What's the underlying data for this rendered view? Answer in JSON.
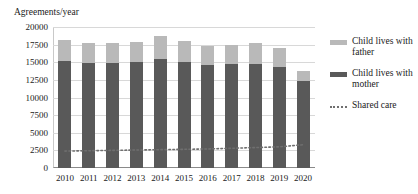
{
  "chart_data": {
    "type": "bar",
    "title": "Agreements/year",
    "xlabel": "",
    "ylabel": "Agreements/year",
    "ylim": [
      0,
      20000
    ],
    "ytick_step": 2500,
    "yticks": [
      20000,
      17500,
      15000,
      12500,
      10000,
      7500,
      5000,
      2500,
      0
    ],
    "ytick_labels": [
      "20000",
      "17500",
      "15000",
      "12500",
      "10000",
      "7500",
      "5000",
      "2500",
      "0"
    ],
    "categories": [
      "2010",
      "2011",
      "2012",
      "2013",
      "2014",
      "2015",
      "2016",
      "2017",
      "2018",
      "2019",
      "2020"
    ],
    "grid": true,
    "stacked": true,
    "legend_position": "right",
    "series": [
      {
        "name": "Child lives with mother",
        "type": "bar",
        "color": "#595959",
        "values": [
          15200,
          14900,
          14900,
          15000,
          15400,
          15100,
          14600,
          14700,
          14800,
          14300,
          12300
        ]
      },
      {
        "name": "Child lives with father",
        "type": "bar",
        "color": "#b9b9b9",
        "values": [
          3000,
          2900,
          2800,
          2900,
          3300,
          2900,
          2700,
          2800,
          2900,
          2700,
          1400
        ]
      },
      {
        "name": "Shared care",
        "type": "line",
        "style": "dotted",
        "color": "#6f6f6f",
        "values": [
          2400,
          2450,
          2500,
          2550,
          2600,
          2650,
          2700,
          2800,
          2900,
          3000,
          3300
        ]
      }
    ],
    "totals": [
      18200,
      17800,
      17700,
      17900,
      18700,
      18000,
      17300,
      17500,
      17700,
      17000,
      13700
    ]
  },
  "legend": {
    "items": [
      {
        "label": "Child lives with father",
        "swatch": "father"
      },
      {
        "label": "Child lives with mother",
        "swatch": "mother"
      },
      {
        "label": "Shared care",
        "swatch": "shared"
      }
    ]
  }
}
